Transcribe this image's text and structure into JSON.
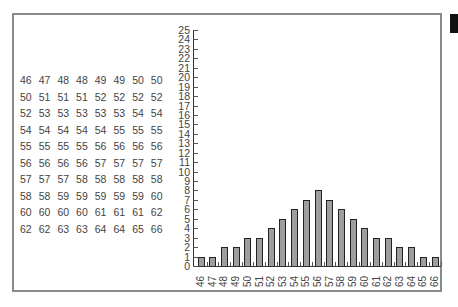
{
  "table": {
    "rows": [
      [
        "46",
        "47",
        "48",
        "48",
        "49",
        "49",
        "50",
        "50"
      ],
      [
        "50",
        "51",
        "51",
        "51",
        "52",
        "52",
        "52",
        "52"
      ],
      [
        "52",
        "53",
        "53",
        "53",
        "53",
        "53",
        "54",
        "54"
      ],
      [
        "54",
        "54",
        "54",
        "54",
        "54",
        "55",
        "55",
        "55"
      ],
      [
        "55",
        "55",
        "55",
        "55",
        "56",
        "56",
        "56",
        "56"
      ],
      [
        "56",
        "56",
        "56",
        "56",
        "57",
        "57",
        "57",
        "57"
      ],
      [
        "57",
        "57",
        "57",
        "58",
        "58",
        "58",
        "58",
        "58"
      ],
      [
        "58",
        "58",
        "59",
        "59",
        "59",
        "59",
        "59",
        "60"
      ],
      [
        "60",
        "60",
        "60",
        "60",
        "61",
        "61",
        "61",
        "62"
      ],
      [
        "62",
        "62",
        "63",
        "63",
        "64",
        "64",
        "65",
        "66"
      ]
    ]
  },
  "chart_data": {
    "type": "bar",
    "title": "",
    "xlabel": "",
    "ylabel": "",
    "categories": [
      "46",
      "47",
      "48",
      "49",
      "50",
      "51",
      "52",
      "53",
      "54",
      "55",
      "56",
      "57",
      "58",
      "59",
      "60",
      "61",
      "62",
      "63",
      "64",
      "65",
      "66"
    ],
    "values": [
      1,
      1,
      2,
      2,
      3,
      3,
      4,
      5,
      6,
      7,
      8,
      7,
      6,
      5,
      4,
      3,
      3,
      2,
      2,
      1,
      1
    ],
    "ylim": [
      0,
      25
    ],
    "yticks": [
      "0",
      "1",
      "2",
      "3",
      "4",
      "5",
      "6",
      "7",
      "8",
      "9",
      "10",
      "11",
      "12",
      "13",
      "14",
      "15",
      "16",
      "17",
      "18",
      "19",
      "20",
      "21",
      "22",
      "23",
      "24",
      "25"
    ],
    "grid": false,
    "legend": null,
    "bar_color": "#9e9e9e",
    "bar_edge_color": "#222222"
  }
}
